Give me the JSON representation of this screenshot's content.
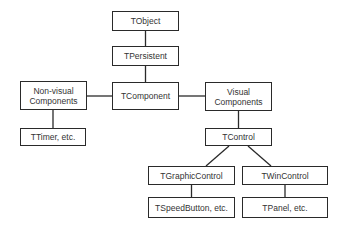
{
  "diagram": {
    "nodes": {
      "tobject": "TObject",
      "tpersistent": "TPersistent",
      "tcomponent": "TComponent",
      "nonvisual_line1": "Non-visual",
      "nonvisual_line2": "Components",
      "visual_line1": "Visual",
      "visual_line2": "Components",
      "ttimer": "TTimer, etc.",
      "tcontrol": "TControl",
      "tgraphiccontrol": "TGraphicControl",
      "twincontrol": "TWinControl",
      "tspeedbutton": "TSpeedButton, etc.",
      "tpanel": "TPanel, etc."
    },
    "edges": [
      [
        "TObject",
        "TPersistent"
      ],
      [
        "TPersistent",
        "TComponent"
      ],
      [
        "TComponent",
        "Non-visual Components"
      ],
      [
        "TComponent",
        "Visual Components"
      ],
      [
        "Non-visual Components",
        "TTimer, etc."
      ],
      [
        "Visual Components",
        "TControl"
      ],
      [
        "TControl",
        "TGraphicControl"
      ],
      [
        "TControl",
        "TWinControl"
      ],
      [
        "TGraphicControl",
        "TSpeedButton, etc."
      ],
      [
        "TWinControl",
        "TPanel, etc."
      ]
    ],
    "line_color": "#2a2a2a"
  }
}
